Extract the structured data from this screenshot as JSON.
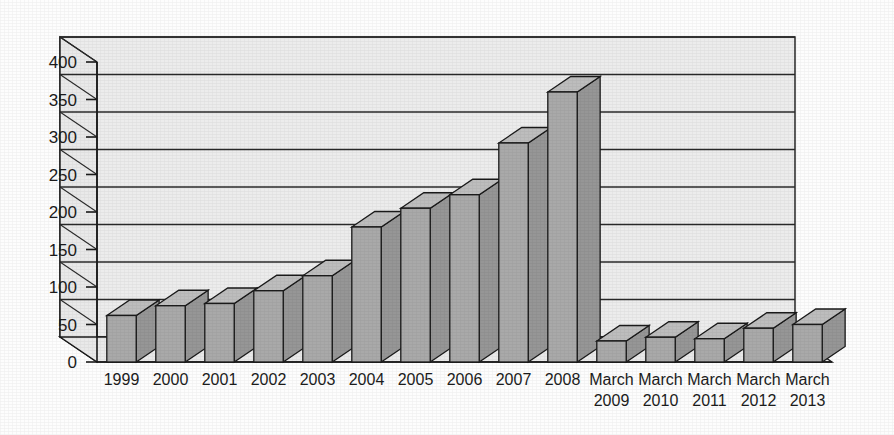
{
  "chart_data": {
    "type": "bar",
    "title": "",
    "subtitle": "",
    "xlabel": "",
    "ylabel": "",
    "ylim": [
      0,
      400
    ],
    "ytick_step": 50,
    "yticks": [
      "0",
      "50",
      "100",
      "150",
      "200",
      "250",
      "300",
      "350",
      "400"
    ],
    "grid": true,
    "legend": "none",
    "style": "3d-column",
    "categories": [
      "1999",
      "2000",
      "2001",
      "2002",
      "2003",
      "2004",
      "2005",
      "2006",
      "2007",
      "2008",
      "March 2009",
      "March 2010",
      "March 2011",
      "March 2012",
      "March 2013"
    ],
    "category_lines": [
      [
        "1999"
      ],
      [
        "2000"
      ],
      [
        "2001"
      ],
      [
        "2002"
      ],
      [
        "2003"
      ],
      [
        "2004"
      ],
      [
        "2005"
      ],
      [
        "2006"
      ],
      [
        "2007"
      ],
      [
        "2008"
      ],
      [
        "March",
        "2009"
      ],
      [
        "March",
        "2010"
      ],
      [
        "March",
        "2011"
      ],
      [
        "March",
        "2012"
      ],
      [
        "March",
        "2013"
      ]
    ],
    "values": [
      62,
      75,
      78,
      95,
      115,
      180,
      205,
      223,
      292,
      360,
      28,
      33,
      31,
      45,
      50
    ]
  },
  "colors": {
    "bar_front": "#a9a9a9",
    "bar_side": "#969696",
    "bar_top": "#bdbdbd",
    "plot_floor": "#e9e9e9",
    "plot_wall": "#ececec",
    "outline": "#1a1a1a",
    "grid_line": "#2a2a2a",
    "text": "#1c1c1c",
    "background": "#fdfdfd"
  }
}
